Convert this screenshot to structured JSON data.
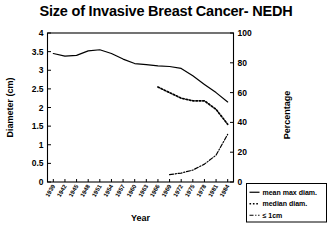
{
  "chart_data": {
    "type": "line",
    "title": "Size of Invasive Breast Cancer- NEDH",
    "xlabel": "Year",
    "ylabel": "Diameter (cm)",
    "y2label": "Percentage",
    "ylim": [
      0,
      4
    ],
    "y2lim": [
      0,
      100
    ],
    "grid": false,
    "legend_position": "bottom-right",
    "yticks": [
      "0",
      "0.5",
      "1",
      "1.5",
      "2",
      "2.5",
      "3",
      "3.5",
      "4"
    ],
    "ytick_values": [
      0,
      0.5,
      1,
      1.5,
      2,
      2.5,
      3,
      3.5,
      4
    ],
    "y2ticks": [
      "0",
      "20",
      "40",
      "60",
      "80",
      "100"
    ],
    "y2tick_values": [
      0,
      20,
      40,
      60,
      80,
      100
    ],
    "categories": [
      "1939",
      "1942",
      "1945",
      "1948",
      "1951",
      "1954",
      "1957",
      "1960",
      "1963",
      "1966",
      "1969",
      "1972",
      "1975",
      "1978",
      "1981",
      "1984"
    ],
    "series": [
      {
        "name": "mean max diam.",
        "style": "solid",
        "axis": "left",
        "values": [
          3.45,
          3.38,
          3.4,
          3.52,
          3.55,
          3.45,
          3.3,
          3.18,
          3.15,
          3.12,
          3.1,
          3.05,
          2.85,
          2.62,
          2.4,
          2.15
        ]
      },
      {
        "name": "median diam.",
        "style": "dotted",
        "axis": "left",
        "values": [
          null,
          null,
          null,
          null,
          null,
          null,
          null,
          null,
          null,
          2.55,
          2.4,
          2.25,
          2.18,
          2.18,
          1.95,
          1.55
        ]
      },
      {
        "name": "≤ 1cm",
        "style": "dashdot",
        "axis": "right",
        "values": [
          null,
          null,
          null,
          null,
          null,
          null,
          null,
          null,
          null,
          null,
          5,
          6,
          8,
          12,
          18,
          32
        ]
      }
    ],
    "legend": [
      {
        "label": "mean max diam.",
        "style": "solid"
      },
      {
        "label": "median diam.",
        "style": "dotted"
      },
      {
        "label": "≤ 1cm",
        "style": "dashdot"
      }
    ]
  }
}
